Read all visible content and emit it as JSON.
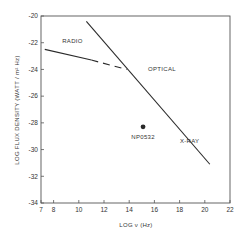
{
  "chart_data": {
    "type": "line",
    "title": "",
    "xlabel": "LOG ν (Hz)",
    "ylabel": "LOG FLUX DENSITY (WATT / m² Hz)",
    "xlim": [
      7,
      22
    ],
    "ylim": [
      -34,
      -20
    ],
    "x_ticks": [
      7,
      8,
      10,
      12,
      14,
      16,
      18,
      20,
      22
    ],
    "y_ticks": [
      -20,
      -22,
      -24,
      -26,
      -28,
      -30,
      -32,
      -34
    ],
    "grid": false,
    "legend": "none",
    "series": [
      {
        "name": "RADIO",
        "style": "solid",
        "points": [
          [
            7.3,
            -22.5
          ],
          [
            11.0,
            -23.3
          ]
        ]
      },
      {
        "name": "RADIO (extrapolated)",
        "style": "dashed",
        "points": [
          [
            11.0,
            -23.3
          ],
          [
            13.8,
            -24.0
          ]
        ]
      },
      {
        "name": "OPTICAL / X-RAY",
        "style": "solid",
        "points": [
          [
            10.6,
            -20.4
          ],
          [
            20.4,
            -31.1
          ]
        ]
      }
    ],
    "points": [
      {
        "name": "NP0532",
        "x": 15.1,
        "y": -28.3
      }
    ],
    "annotations": [
      {
        "text": "RADIO",
        "x": 9.5,
        "y": -22.0
      },
      {
        "text": "OPTICAL",
        "x": 16.6,
        "y": -24.1
      },
      {
        "text": "X-RAY",
        "x": 18.8,
        "y": -29.5
      },
      {
        "text": "NP0532",
        "x": 15.1,
        "y": -29.2
      }
    ]
  },
  "labels": {
    "xlabel": "LOG ν (Hz)",
    "ylabel": "LOG FLUX DENSITY (WATT / m² Hz)",
    "radio": "RADIO",
    "optical": "OPTICAL",
    "xray": "X-RAY",
    "np0532": "NP0532"
  },
  "colors": {
    "line": "#2a2a2a",
    "frame": "#555555",
    "text": "#333333"
  }
}
